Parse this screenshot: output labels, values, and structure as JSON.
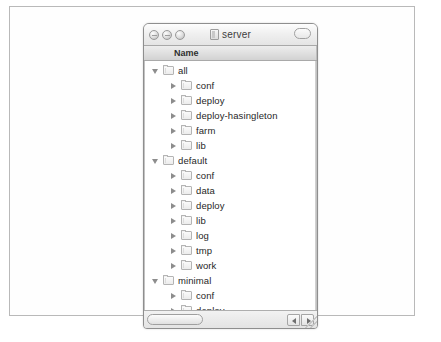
{
  "window": {
    "title": "server",
    "title_icon": "folder-icon",
    "controls": {
      "close_label": "close",
      "minimize_label": "minimize",
      "zoom_label": "zoom",
      "toolbar_toggle_label": "toolbar-toggle"
    }
  },
  "column_header": {
    "name": "Name"
  },
  "rows": [
    {
      "label": "all",
      "depth": 0,
      "state": "open"
    },
    {
      "label": "conf",
      "depth": 1,
      "state": "closed"
    },
    {
      "label": "deploy",
      "depth": 1,
      "state": "closed"
    },
    {
      "label": "deploy-hasingleton",
      "depth": 1,
      "state": "closed"
    },
    {
      "label": "farm",
      "depth": 1,
      "state": "closed"
    },
    {
      "label": "lib",
      "depth": 1,
      "state": "closed"
    },
    {
      "label": "default",
      "depth": 0,
      "state": "open"
    },
    {
      "label": "conf",
      "depth": 1,
      "state": "closed"
    },
    {
      "label": "data",
      "depth": 1,
      "state": "closed"
    },
    {
      "label": "deploy",
      "depth": 1,
      "state": "closed"
    },
    {
      "label": "lib",
      "depth": 1,
      "state": "closed"
    },
    {
      "label": "log",
      "depth": 1,
      "state": "closed"
    },
    {
      "label": "tmp",
      "depth": 1,
      "state": "closed"
    },
    {
      "label": "work",
      "depth": 1,
      "state": "closed"
    },
    {
      "label": "minimal",
      "depth": 0,
      "state": "open"
    },
    {
      "label": "conf",
      "depth": 1,
      "state": "closed"
    },
    {
      "label": "deploy",
      "depth": 1,
      "state": "closed"
    },
    {
      "label": "lib",
      "depth": 1,
      "state": "closed"
    }
  ],
  "scrollbar": {
    "left_arrow": "scroll-left",
    "right_arrow": "scroll-right"
  },
  "colors": {
    "window_chrome": "#f4f4f4",
    "list_background": "#ffffff",
    "text": "#1f1f1f",
    "border": "#8e8e8e"
  }
}
